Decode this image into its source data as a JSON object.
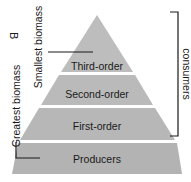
{
  "panel_letter": "B",
  "tiers": [
    {
      "label": "Third-order"
    },
    {
      "label": "Second-order"
    },
    {
      "label": "First-order"
    },
    {
      "label": "Producers"
    }
  ],
  "labels": {
    "smallest": "Smallest biomass",
    "greatest": "Greatest biomass",
    "consumers": "consumers"
  },
  "colors": {
    "tier_fill": "#b9b9b9",
    "line": "#1a1a1a"
  }
}
